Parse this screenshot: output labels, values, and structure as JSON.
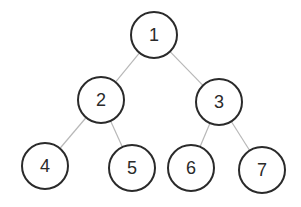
{
  "diagram": {
    "type": "binary-tree",
    "edge_color": "#b8b8b8",
    "node_stroke": "#2a2a2a",
    "node_radius": 23,
    "nodes": [
      {
        "id": "1",
        "label": "1",
        "x": 154,
        "y": 35
      },
      {
        "id": "2",
        "label": "2",
        "x": 101,
        "y": 100
      },
      {
        "id": "3",
        "label": "3",
        "x": 219,
        "y": 102
      },
      {
        "id": "4",
        "label": "4",
        "x": 45,
        "y": 166
      },
      {
        "id": "5",
        "label": "5",
        "x": 132,
        "y": 168
      },
      {
        "id": "6",
        "label": "6",
        "x": 191,
        "y": 168
      },
      {
        "id": "7",
        "label": "7",
        "x": 262,
        "y": 170
      }
    ],
    "edges": [
      {
        "from": "1",
        "to": "2"
      },
      {
        "from": "1",
        "to": "3"
      },
      {
        "from": "2",
        "to": "4"
      },
      {
        "from": "2",
        "to": "5"
      },
      {
        "from": "3",
        "to": "6"
      },
      {
        "from": "3",
        "to": "7"
      }
    ]
  }
}
